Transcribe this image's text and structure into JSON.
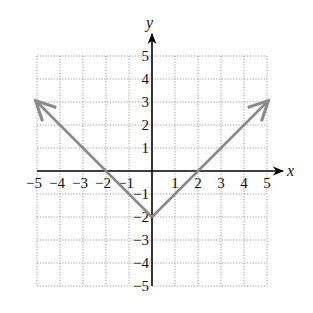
{
  "chart_data": {
    "type": "line",
    "title": "",
    "xlabel": "x",
    "ylabel": "y",
    "xlim": [
      -5,
      5
    ],
    "ylim": [
      -5,
      5
    ],
    "grid": true,
    "x_ticks": [
      -5,
      -4,
      -3,
      -2,
      -1,
      1,
      2,
      3,
      4,
      5
    ],
    "y_ticks": [
      5,
      4,
      3,
      2,
      1,
      -1,
      -2,
      -3,
      -4,
      -5
    ],
    "x_tick_labels": [
      "−5",
      "−4",
      "−3",
      "−2",
      "−1",
      "1",
      "2",
      "3",
      "4",
      "5"
    ],
    "y_tick_labels": [
      "5",
      "4",
      "3",
      "2",
      "1",
      "−1",
      "−2",
      "−3",
      "−4",
      "−5"
    ],
    "series": [
      {
        "name": "y = |x| − 2",
        "color": "#8a8a8a",
        "arrows_at_ends": true,
        "points": [
          [
            -5,
            3
          ],
          [
            -2,
            0
          ],
          [
            0,
            -2
          ],
          [
            2,
            0
          ],
          [
            5,
            3
          ]
        ]
      }
    ],
    "legend": null
  },
  "style": {
    "axis_color": "#000000",
    "grid_color": "#9a9a9a",
    "line_color": "#8a8a8a"
  }
}
